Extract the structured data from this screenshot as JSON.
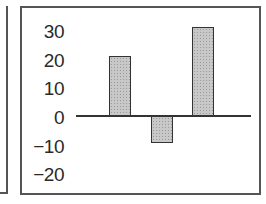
{
  "chart_data": {
    "type": "bar",
    "title": "",
    "xlabel": "",
    "ylabel": "",
    "categories": [
      "1",
      "2",
      "3"
    ],
    "values": [
      21,
      -9.5,
      31
    ],
    "ylim": [
      -25,
      33
    ],
    "yticks": [
      30,
      20,
      10,
      0,
      -10,
      -20
    ],
    "ytick_labels": [
      "30",
      "20",
      "10",
      "0",
      "−10",
      "−20"
    ],
    "grid": false,
    "legend": null,
    "bar_color": "#c8c8c8",
    "bar_edge_color": "#333333"
  }
}
